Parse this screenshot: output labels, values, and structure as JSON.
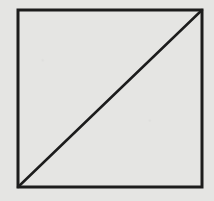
{
  "diagram": {
    "shape": "square-with-diagonal",
    "square": {
      "x": 18,
      "y": 10,
      "width": 184,
      "height": 177
    },
    "diagonal": {
      "from": "bottom-left",
      "to": "top-right",
      "x1": 18,
      "y1": 187,
      "x2": 202,
      "y2": 10
    },
    "stroke_width": 3,
    "colors": {
      "background": "#e5e5e3",
      "stroke": "#1c1c1c"
    }
  }
}
